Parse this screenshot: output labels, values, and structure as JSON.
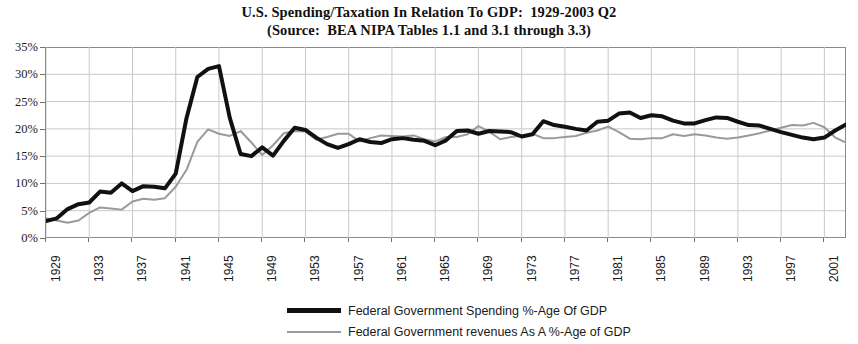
{
  "chart_data": {
    "type": "line",
    "title": "U.S. Spending/Taxation In Relation To GDP:  1929-2003 Q2",
    "subtitle": "(Source:  BEA NIPA Tables 1.1 and 3.1 through 3.3)",
    "xlabel": "",
    "ylabel": "",
    "xlim": [
      1929,
      2003
    ],
    "ylim": [
      0,
      35
    ],
    "grid": true,
    "legend_position": "bottom-center",
    "y_tick_labels": [
      "0%",
      "5%",
      "10%",
      "15%",
      "20%",
      "25%",
      "30%",
      "35%"
    ],
    "y_tick_values": [
      0,
      5,
      10,
      15,
      20,
      25,
      30,
      35
    ],
    "x_tick_labels": [
      "1929",
      "1933",
      "1937",
      "1941",
      "1945",
      "1949",
      "1953",
      "1957",
      "1961",
      "1965",
      "1969",
      "1973",
      "1977",
      "1981",
      "1985",
      "1989",
      "1993",
      "1997",
      "2001"
    ],
    "x_tick_values": [
      1929,
      1933,
      1937,
      1941,
      1945,
      1949,
      1953,
      1957,
      1961,
      1965,
      1969,
      1973,
      1977,
      1981,
      1985,
      1989,
      1993,
      1997,
      2001
    ],
    "x": [
      1929,
      1930,
      1931,
      1932,
      1933,
      1934,
      1935,
      1936,
      1937,
      1938,
      1939,
      1940,
      1941,
      1942,
      1943,
      1944,
      1945,
      1946,
      1947,
      1948,
      1949,
      1950,
      1951,
      1952,
      1953,
      1954,
      1955,
      1956,
      1957,
      1958,
      1959,
      1960,
      1961,
      1962,
      1963,
      1964,
      1965,
      1966,
      1967,
      1968,
      1969,
      1970,
      1971,
      1972,
      1973,
      1974,
      1975,
      1976,
      1977,
      1978,
      1979,
      1980,
      1981,
      1982,
      1983,
      1984,
      1985,
      1986,
      1987,
      1988,
      1989,
      1990,
      1991,
      1992,
      1993,
      1994,
      1995,
      1996,
      1997,
      1998,
      1999,
      2000,
      2001,
      2002,
      2003
    ],
    "series": [
      {
        "name": "Federal Government Spending %-Age Of GDP",
        "color": "#111111",
        "line_width": 4,
        "values": [
          3.1,
          3.6,
          5.3,
          6.2,
          6.5,
          8.5,
          8.3,
          10.0,
          8.6,
          9.5,
          9.4,
          9.1,
          11.8,
          22.0,
          29.5,
          31.0,
          31.5,
          22.0,
          15.4,
          15.0,
          16.6,
          15.1,
          17.8,
          20.2,
          19.8,
          18.4,
          17.2,
          16.5,
          17.2,
          18.1,
          17.6,
          17.4,
          18.1,
          18.3,
          18.0,
          17.8,
          17.0,
          17.9,
          19.6,
          19.7,
          19.1,
          19.6,
          19.5,
          19.4,
          18.6,
          19.0,
          21.4,
          20.7,
          20.4,
          20.0,
          19.7,
          21.3,
          21.5,
          22.8,
          23.0,
          22.0,
          22.5,
          22.3,
          21.5,
          21.0,
          21.0,
          21.6,
          22.1,
          22.0,
          21.3,
          20.7,
          20.6,
          20.0,
          19.4,
          18.9,
          18.4,
          18.1,
          18.4,
          19.7,
          20.8
        ]
      },
      {
        "name": "Federal Government revenues As A %-Age of GDP",
        "color": "#9a9a9a",
        "line_width": 2,
        "values": [
          3.6,
          3.2,
          2.8,
          3.2,
          4.6,
          5.6,
          5.4,
          5.2,
          6.7,
          7.2,
          7.0,
          7.3,
          9.4,
          12.5,
          17.6,
          19.9,
          19.1,
          18.7,
          19.6,
          17.5,
          15.2,
          17.0,
          19.2,
          19.6,
          19.5,
          18.0,
          18.5,
          19.1,
          19.1,
          17.7,
          18.3,
          18.8,
          18.7,
          18.6,
          18.8,
          18.1,
          17.7,
          18.5,
          18.5,
          19.0,
          20.5,
          19.5,
          18.1,
          18.5,
          18.7,
          19.1,
          18.3,
          18.3,
          18.5,
          18.7,
          19.3,
          19.7,
          20.4,
          19.4,
          18.2,
          18.1,
          18.3,
          18.3,
          19.0,
          18.7,
          19.0,
          18.8,
          18.4,
          18.2,
          18.4,
          18.8,
          19.2,
          19.7,
          20.2,
          20.7,
          20.6,
          21.1,
          20.3,
          18.4,
          17.5
        ]
      }
    ]
  },
  "legend": {
    "items": [
      {
        "label": "Federal Government Spending %-Age Of GDP"
      },
      {
        "label": "Federal Government revenues As A %-Age of GDP"
      }
    ]
  }
}
